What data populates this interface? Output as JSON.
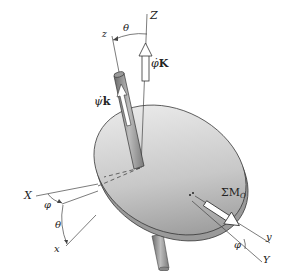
{
  "figure": {
    "type": "gyroscope / spinning disk with Euler angles",
    "labels": {
      "fixed_Z": "Z",
      "body_z": "z",
      "theta_top": "θ",
      "precession_rate": "φ̇",
      "precession_unit": "K",
      "spin_rate": "ψ̇",
      "spin_unit": "k",
      "fixed_X": "X",
      "phi_left": "φ",
      "theta_left": "θ",
      "body_x": "x",
      "moment_sigma": "ΣM",
      "moment_sub": "O",
      "phi_right": "φ",
      "body_y": "y",
      "fixed_Y": "Y"
    },
    "colors": {
      "disk_light": "#eeeeee",
      "disk_dark": "#8a8a8a",
      "rod": "#9a9a9a",
      "line": "#444444"
    }
  }
}
